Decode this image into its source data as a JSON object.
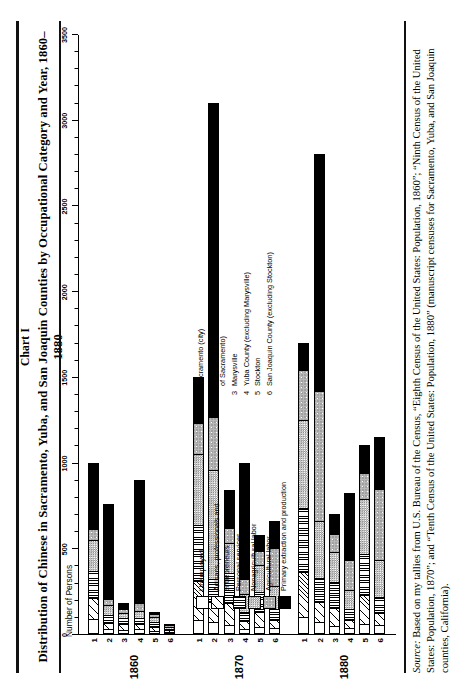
{
  "header": {
    "chart_number": "Chart I",
    "title": "Distribution of Chinese in Sacramento, Yuba, and San Joaquin Counties by Occupational Category and Year, 1860–1880"
  },
  "source": {
    "prefix": "Source:",
    "text": " Based on my tallies from U.S. Bureau of the Census, “Eighth Census of the United States: Population, 1860”; “Ninth Census of the United States: Population, 1870”; and “Tenth Census of the United States: Population, 1880” (manuscript censuses for Sacramento, Yuba, and San Joaquin counties, California)."
  },
  "axis": {
    "ylabel": "Number of Persons"
  },
  "legend_occupations": [
    {
      "key": "unemployed",
      "label": "Unemployed",
      "pattern": "p0"
    },
    {
      "key": "artisans",
      "label": "Artisans, professionals and\nentrepreneurs",
      "pattern": "p1"
    },
    {
      "key": "personal",
      "label": "Personal services",
      "pattern": "p2"
    },
    {
      "key": "nonagri",
      "label": "Nonagricultural labor",
      "pattern": "p3"
    },
    {
      "key": "agri",
      "label": "Agricultural labor",
      "pattern": "p4"
    },
    {
      "key": "primary",
      "label": "Primary extraction and production",
      "pattern": "p5"
    }
  ],
  "legend_places": [
    {
      "num": "1",
      "label": "Sacramento (city)"
    },
    {
      "num": "2",
      "label": "Sacramento County (excluding city\nof Sacramento)"
    },
    {
      "num": "3",
      "label": "Marysville"
    },
    {
      "num": "4",
      "label": "Yuba County (excluding Marysville)"
    },
    {
      "num": "5",
      "label": "Stockton"
    },
    {
      "num": "6",
      "label": "San Joaquin County (excluding Stockton)"
    }
  ],
  "chart_data": {
    "type": "bar",
    "orientation": "horizontal",
    "title": "Distribution of Chinese in Sacramento, Yuba, and San Joaquin Counties by Occupational Category and Year, 1860–1880",
    "xlabel": "Number of Persons",
    "ylabel": "",
    "xlim": [
      0,
      3500
    ],
    "ticks": [
      0,
      500,
      1000,
      1500,
      2000,
      2500,
      3000,
      3500
    ],
    "tick_labels": [
      "0",
      "500",
      "1000",
      "1500",
      "2000",
      "2500",
      "3000",
      "3500"
    ],
    "minor_tick_step": 100,
    "grid": false,
    "legend_position": "inside-left",
    "stacked": true,
    "series": [
      {
        "name": "Unemployed",
        "pattern": "p0"
      },
      {
        "name": "Artisans, professionals and entrepreneurs",
        "pattern": "p1"
      },
      {
        "name": "Personal services",
        "pattern": "p2"
      },
      {
        "name": "Nonagricultural labor",
        "pattern": "p3"
      },
      {
        "name": "Agricultural labor",
        "pattern": "p4"
      },
      {
        "name": "Primary extraction and production",
        "pattern": "p5"
      }
    ],
    "groups": [
      {
        "year": "1860",
        "categories": [
          "1",
          "2",
          "3",
          "4",
          "5",
          "6"
        ],
        "bars": [
          {
            "category": "1",
            "total": 1000,
            "segments": [
              {
                "series": "Unemployed",
                "value": 80
              },
              {
                "series": "Artisans, professionals and entrepreneurs",
                "value": 120
              },
              {
                "series": "Personal services",
                "value": 160
              },
              {
                "series": "Nonagricultural labor",
                "value": 180
              },
              {
                "series": "Agricultural labor",
                "value": 60
              },
              {
                "series": "Primary extraction and production",
                "value": 400
              }
            ]
          },
          {
            "category": "2",
            "total": 760,
            "segments": [
              {
                "series": "Unemployed",
                "value": 20
              },
              {
                "series": "Artisans, professionals and entrepreneurs",
                "value": 30
              },
              {
                "series": "Personal services",
                "value": 40
              },
              {
                "series": "Nonagricultural labor",
                "value": 60
              },
              {
                "series": "Agricultural labor",
                "value": 30
              },
              {
                "series": "Primary extraction and production",
                "value": 580
              }
            ]
          },
          {
            "category": "3",
            "total": 180,
            "segments": [
              {
                "series": "Unemployed",
                "value": 15
              },
              {
                "series": "Artisans, professionals and entrepreneurs",
                "value": 35
              },
              {
                "series": "Personal services",
                "value": 40
              },
              {
                "series": "Nonagricultural labor",
                "value": 30
              },
              {
                "series": "Agricultural labor",
                "value": 20
              },
              {
                "series": "Primary extraction and production",
                "value": 40
              }
            ]
          },
          {
            "category": "4",
            "total": 900,
            "segments": [
              {
                "series": "Unemployed",
                "value": 20
              },
              {
                "series": "Artisans, professionals and entrepreneurs",
                "value": 25
              },
              {
                "series": "Personal services",
                "value": 30
              },
              {
                "series": "Nonagricultural labor",
                "value": 35
              },
              {
                "series": "Agricultural labor",
                "value": 40
              },
              {
                "series": "Primary extraction and production",
                "value": 750
              }
            ]
          },
          {
            "category": "5",
            "total": 130,
            "segments": [
              {
                "series": "Unemployed",
                "value": 10
              },
              {
                "series": "Artisans, professionals and entrepreneurs",
                "value": 25
              },
              {
                "series": "Personal services",
                "value": 35
              },
              {
                "series": "Nonagricultural labor",
                "value": 30
              },
              {
                "series": "Agricultural labor",
                "value": 20
              },
              {
                "series": "Primary extraction and production",
                "value": 10
              }
            ]
          },
          {
            "category": "6",
            "total": 60,
            "segments": [
              {
                "series": "Unemployed",
                "value": 5
              },
              {
                "series": "Artisans, professionals and entrepreneurs",
                "value": 8
              },
              {
                "series": "Personal services",
                "value": 10
              },
              {
                "series": "Nonagricultural labor",
                "value": 12
              },
              {
                "series": "Agricultural labor",
                "value": 15
              },
              {
                "series": "Primary extraction and production",
                "value": 10
              }
            ]
          }
        ]
      },
      {
        "year": "1870",
        "categories": [
          "1",
          "2",
          "3",
          "4",
          "5",
          "6"
        ],
        "bars": [
          {
            "category": "1",
            "total": 1500,
            "segments": [
              {
                "series": "Unemployed",
                "value": 70
              },
              {
                "series": "Artisans, professionals and entrepreneurs",
                "value": 230
              },
              {
                "series": "Personal services",
                "value": 330
              },
              {
                "series": "Nonagricultural labor",
                "value": 420
              },
              {
                "series": "Agricultural labor",
                "value": 180
              },
              {
                "series": "Primary extraction and production",
                "value": 270
              }
            ]
          },
          {
            "category": "2",
            "total": 3100,
            "segments": [
              {
                "series": "Unemployed",
                "value": 60
              },
              {
                "series": "Artisans, professionals and entrepreneurs",
                "value": 110
              },
              {
                "series": "Personal services",
                "value": 130
              },
              {
                "series": "Nonagricultural labor",
                "value": 640
              },
              {
                "series": "Agricultural labor",
                "value": 310
              },
              {
                "series": "Primary extraction and production",
                "value": 1850
              }
            ]
          },
          {
            "category": "3",
            "total": 840,
            "segments": [
              {
                "series": "Unemployed",
                "value": 40
              },
              {
                "series": "Artisans, professionals and entrepreneurs",
                "value": 130
              },
              {
                "series": "Personal services",
                "value": 180
              },
              {
                "series": "Nonagricultural labor",
                "value": 180
              },
              {
                "series": "Agricultural labor",
                "value": 80
              },
              {
                "series": "Primary extraction and production",
                "value": 230
              }
            ]
          },
          {
            "category": "4",
            "total": 1000,
            "segments": [
              {
                "series": "Unemployed",
                "value": 20
              },
              {
                "series": "Artisans, professionals and entrepreneurs",
                "value": 40
              },
              {
                "series": "Personal services",
                "value": 50
              },
              {
                "series": "Nonagricultural labor",
                "value": 100
              },
              {
                "series": "Agricultural labor",
                "value": 90
              },
              {
                "series": "Primary extraction and production",
                "value": 700
              }
            ]
          },
          {
            "category": "5",
            "total": 580,
            "segments": [
              {
                "series": "Unemployed",
                "value": 30
              },
              {
                "series": "Artisans, professionals and entrepreneurs",
                "value": 90
              },
              {
                "series": "Personal services",
                "value": 120
              },
              {
                "series": "Nonagricultural labor",
                "value": 160
              },
              {
                "series": "Agricultural labor",
                "value": 80
              },
              {
                "series": "Primary extraction and production",
                "value": 100
              }
            ]
          },
          {
            "category": "6",
            "total": 660,
            "segments": [
              {
                "series": "Unemployed",
                "value": 25
              },
              {
                "series": "Artisans, professionals and entrepreneurs",
                "value": 45
              },
              {
                "series": "Personal services",
                "value": 60
              },
              {
                "series": "Nonagricultural labor",
                "value": 140
              },
              {
                "series": "Agricultural labor",
                "value": 230
              },
              {
                "series": "Primary extraction and production",
                "value": 160
              }
            ]
          }
        ]
      },
      {
        "year": "1880",
        "categories": [
          "1",
          "2",
          "3",
          "4",
          "5",
          "6"
        ],
        "bars": [
          {
            "category": "1",
            "total": 1700,
            "segments": [
              {
                "series": "Unemployed",
                "value": 90
              },
              {
                "series": "Artisans, professionals and entrepreneurs",
                "value": 260
              },
              {
                "series": "Personal services",
                "value": 380
              },
              {
                "series": "Nonagricultural labor",
                "value": 520
              },
              {
                "series": "Agricultural labor",
                "value": 290
              },
              {
                "series": "Primary extraction and production",
                "value": 160
              }
            ]
          },
          {
            "category": "2",
            "total": 2800,
            "segments": [
              {
                "series": "Unemployed",
                "value": 60
              },
              {
                "series": "Artisans, professionals and entrepreneurs",
                "value": 110
              },
              {
                "series": "Personal services",
                "value": 140
              },
              {
                "series": "Nonagricultural labor",
                "value": 330
              },
              {
                "series": "Agricultural labor",
                "value": 760
              },
              {
                "series": "Primary extraction and production",
                "value": 1400
              }
            ]
          },
          {
            "category": "3",
            "total": 700,
            "segments": [
              {
                "series": "Unemployed",
                "value": 35
              },
              {
                "series": "Artisans, professionals and entrepreneurs",
                "value": 110
              },
              {
                "series": "Personal services",
                "value": 150
              },
              {
                "series": "Nonagricultural labor",
                "value": 180
              },
              {
                "series": "Agricultural labor",
                "value": 105
              },
              {
                "series": "Primary extraction and production",
                "value": 120
              }
            ]
          },
          {
            "category": "4",
            "total": 820,
            "segments": [
              {
                "series": "Unemployed",
                "value": 25
              },
              {
                "series": "Artisans, professionals and entrepreneurs",
                "value": 45
              },
              {
                "series": "Personal services",
                "value": 60
              },
              {
                "series": "Nonagricultural labor",
                "value": 110
              },
              {
                "series": "Agricultural labor",
                "value": 180
              },
              {
                "series": "Primary extraction and production",
                "value": 400
              }
            ]
          },
          {
            "category": "5",
            "total": 1100,
            "segments": [
              {
                "series": "Unemployed",
                "value": 50
              },
              {
                "series": "Artisans, professionals and entrepreneurs",
                "value": 170
              },
              {
                "series": "Personal services",
                "value": 240
              },
              {
                "series": "Nonagricultural labor",
                "value": 330
              },
              {
                "series": "Agricultural labor",
                "value": 150
              },
              {
                "series": "Primary extraction and production",
                "value": 160
              }
            ]
          },
          {
            "category": "6",
            "total": 1150,
            "segments": [
              {
                "series": "Unemployed",
                "value": 40
              },
              {
                "series": "Artisans, professionals and entrepreneurs",
                "value": 70
              },
              {
                "series": "Personal services",
                "value": 90
              },
              {
                "series": "Nonagricultural labor",
                "value": 220
              },
              {
                "series": "Agricultural labor",
                "value": 420
              },
              {
                "series": "Primary extraction and production",
                "value": 310
              }
            ]
          }
        ]
      }
    ]
  }
}
